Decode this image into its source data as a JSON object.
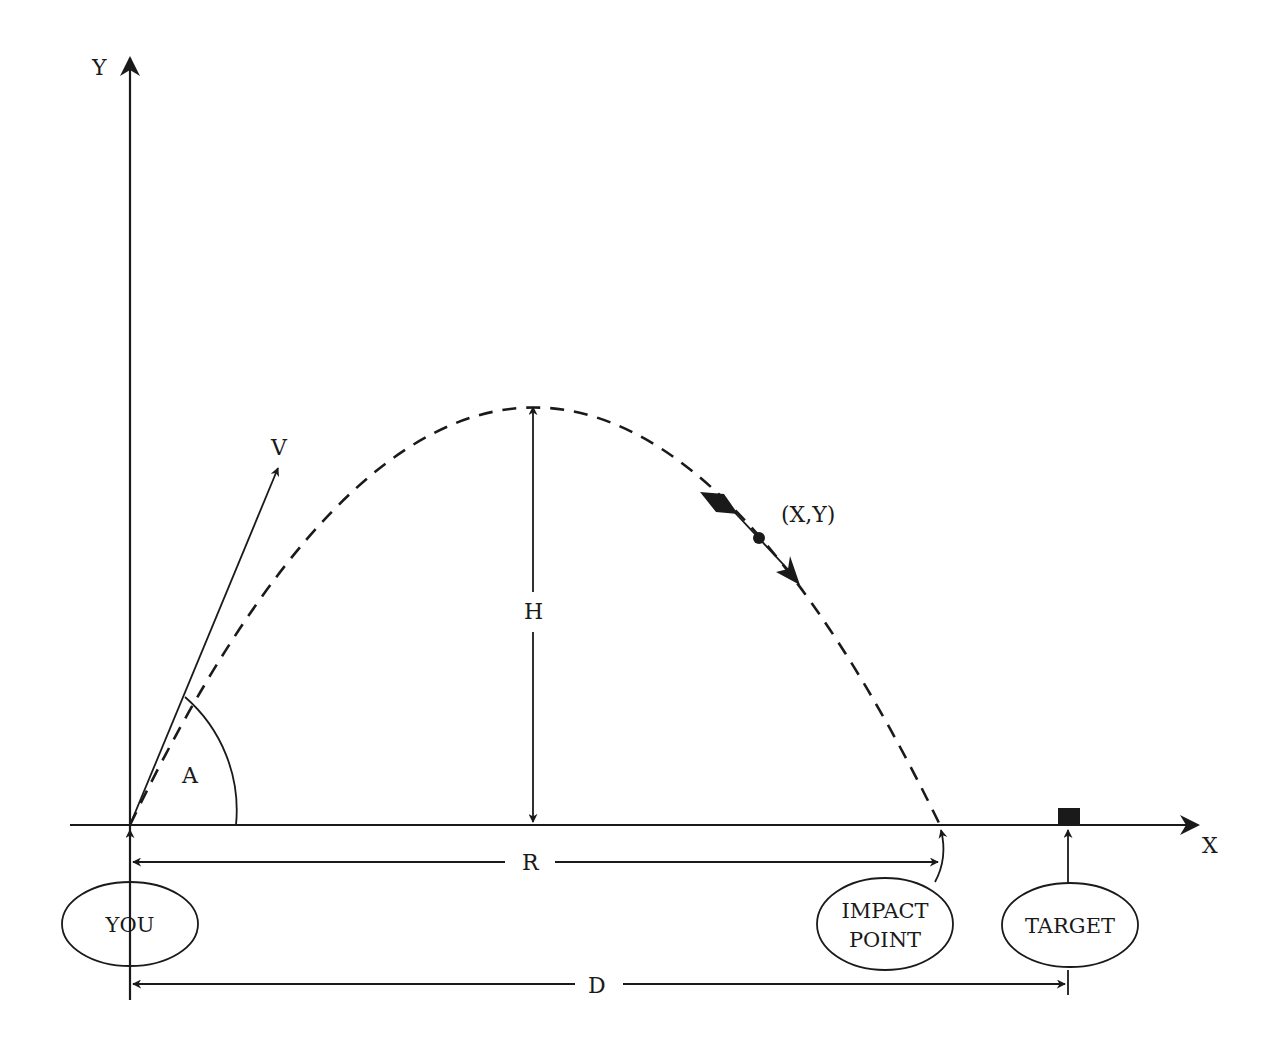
{
  "diagram": {
    "axes": {
      "x_label": "X",
      "y_label": "Y"
    },
    "labels": {
      "velocity": "V",
      "angle": "A",
      "height": "H",
      "range": "R",
      "distance": "D",
      "position": "(X,Y)"
    },
    "nodes": {
      "you": "YOU",
      "impact_line1": "IMPACT",
      "impact_line2": "POINT",
      "target": "TARGET"
    },
    "colors": {
      "ink": "#1a1a1a",
      "background": "#ffffff"
    }
  }
}
